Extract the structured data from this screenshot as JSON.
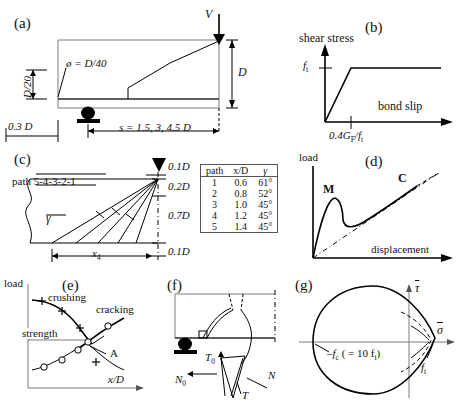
{
  "figure": {
    "panels": [
      {
        "id": "a",
        "letter": "(a)",
        "title": "beam specimen geometry"
      },
      {
        "id": "b",
        "letter": "(b)",
        "title": "bond slip law"
      },
      {
        "id": "c",
        "letter": "(c)",
        "title": "crack paths"
      },
      {
        "id": "d",
        "letter": "(d)",
        "title": "load displacement response"
      },
      {
        "id": "e",
        "letter": "(e)",
        "title": "strength vs x/D"
      },
      {
        "id": "f",
        "letter": "(f)",
        "title": "free body diagram"
      },
      {
        "id": "g",
        "letter": "(g)",
        "title": "failure envelope"
      }
    ]
  },
  "panel_a": {
    "letter": "(a)",
    "load_label": "V",
    "depth_label": "D",
    "cover_label": "D/20",
    "bar_label": "ø = D/40",
    "left_offset_label": "0.3 D",
    "span_label": "s = 1.5, 3, 4.5 D"
  },
  "panel_b": {
    "letter": "(b)",
    "y_axis": "shear stress",
    "x_axis": "bond slip",
    "y_tick": "f",
    "y_tick_sub": "t",
    "x_tick": "0.4G",
    "x_tick_sub": "F",
    "x_tick_rest": "/f",
    "x_tick_sub2": "t"
  },
  "panel_c": {
    "letter": "(c)",
    "path_label": "path 5-4-3-2-1",
    "gamma_label": "γ",
    "x4_label": "x",
    "x4_sub": "4",
    "dims": [
      "0.1D",
      "0.2D",
      "0.7D",
      "0.1D"
    ],
    "table": {
      "headers": [
        "path",
        "x/D",
        "γ"
      ],
      "rows": [
        [
          "1",
          "0.6",
          "61°"
        ],
        [
          "2",
          "0.8",
          "52°"
        ],
        [
          "3",
          "1.0",
          "45°"
        ],
        [
          "4",
          "1.2",
          "45°"
        ],
        [
          "5",
          "1.4",
          "45°"
        ]
      ]
    }
  },
  "panel_d": {
    "letter": "(d)",
    "y_axis": "load",
    "x_axis": "displacement",
    "marker_m": "M",
    "marker_c": "C"
  },
  "panel_e": {
    "letter": "(e)",
    "y_axis": "load",
    "x_axis": "x/D",
    "curve_crushing": "crushing",
    "curve_cracking": "cracking",
    "strength_label": "strength",
    "point_a": "A"
  },
  "panel_f": {
    "letter": "(f)",
    "forces": [
      {
        "name": "T",
        "sub": "0"
      },
      {
        "name": "N",
        "sub": "0"
      },
      {
        "name": "T",
        "sub": ""
      },
      {
        "name": "N",
        "sub": ""
      }
    ]
  },
  "panel_g": {
    "letter": "(g)",
    "y_axis": "τ",
    "x_axis": "σ",
    "fc_label": "–f",
    "fc_sub": "c",
    "fc_rest": " ( = 10 f",
    "fc_sub2": "t",
    "fc_close": ")",
    "ft_label": "f",
    "ft_sub": "t"
  }
}
